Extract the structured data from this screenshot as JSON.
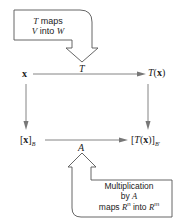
{
  "diagram": {
    "top_callout": {
      "line1_var": "T",
      "line1_text": " maps",
      "line2_var1": "V",
      "line2_text": " into ",
      "line2_var2": "W"
    },
    "nodes": {
      "x": "x",
      "Tx_T": "T",
      "Tx_paren_open": "(",
      "Tx_x": "x",
      "Tx_paren_close": ")",
      "xB_open": "[",
      "xB_x": "x",
      "xB_close": "]",
      "xB_sub": "B",
      "TxB_open": "[",
      "TxB_T": "T",
      "TxB_paren_open": "(",
      "TxB_x": "x",
      "TxB_paren_close": ")]",
      "TxB_sub": "B′"
    },
    "edges": {
      "top_label": "T",
      "bottom_label": "A"
    },
    "bottom_callout": {
      "line1": "Multiplication",
      "line2_text": "by ",
      "line2_var": "A",
      "line3_text1": "maps ",
      "line3_var1": "R",
      "line3_sup1": "n",
      "line3_text2": " into ",
      "line3_var2": "R",
      "line3_sup2": "m"
    },
    "colors": {
      "stroke": "#555555",
      "arrow_fill": "#777777",
      "text": "#222222"
    }
  }
}
